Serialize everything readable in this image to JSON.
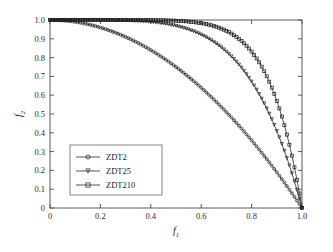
{
  "chart_data": {
    "type": "line",
    "title": "",
    "subtitle": "",
    "xlabel": "f",
    "xlabel_sub": "1",
    "ylabel": "f",
    "ylabel_sub": "2",
    "xlim": [
      0,
      1
    ],
    "ylim": [
      0,
      1
    ],
    "grid": false,
    "legend_position": "center-left",
    "xticks": [
      0,
      0.2,
      0.4,
      0.6,
      0.8,
      1.0
    ],
    "xtick_labels": [
      "0",
      "0.2",
      "0.4",
      "0.6",
      "0.8",
      "1.0"
    ],
    "yticks": [
      0,
      0.1,
      0.2,
      0.3,
      0.4,
      0.5,
      0.6,
      0.7,
      0.8,
      0.9,
      1.0
    ],
    "ytick_labels": [
      "0",
      "0.1",
      "0.2",
      "0.3",
      "0.4",
      "0.5",
      "0.6",
      "0.7",
      "0.8",
      "0.9",
      "1.0"
    ],
    "x": [
      0,
      0.02,
      0.04,
      0.06,
      0.08,
      0.1,
      0.12,
      0.14,
      0.16,
      0.18,
      0.2,
      0.22,
      0.24,
      0.26,
      0.28,
      0.3,
      0.32,
      0.34,
      0.36,
      0.38,
      0.4,
      0.42,
      0.44,
      0.46,
      0.48,
      0.5,
      0.52,
      0.54,
      0.56,
      0.58,
      0.6,
      0.62,
      0.64,
      0.66,
      0.68,
      0.7,
      0.72,
      0.74,
      0.76,
      0.78,
      0.8,
      0.82,
      0.84,
      0.86,
      0.88,
      0.9,
      0.92,
      0.94,
      0.96,
      0.98,
      1.0
    ],
    "series": [
      {
        "name": "ZDT2",
        "marker": "circle",
        "exponent": 2,
        "values": [
          1.0,
          0.9996,
          0.9984,
          0.9964,
          0.9936,
          0.99,
          0.9856,
          0.9804,
          0.9744,
          0.9676,
          0.96,
          0.9516,
          0.9424,
          0.9324,
          0.9216,
          0.91,
          0.8976,
          0.8844,
          0.8704,
          0.8556,
          0.84,
          0.8236,
          0.8064,
          0.7884,
          0.7696,
          0.75,
          0.7296,
          0.7084,
          0.6864,
          0.6636,
          0.64,
          0.6156,
          0.5904,
          0.5644,
          0.5376,
          0.51,
          0.4816,
          0.4524,
          0.4224,
          0.3916,
          0.36,
          0.3276,
          0.2944,
          0.2604,
          0.2256,
          0.19,
          0.1536,
          0.1164,
          0.0784,
          0.0396,
          0.0
        ]
      },
      {
        "name": "ZDT25",
        "marker": "triangle-down",
        "exponent": 5,
        "values": [
          1.0,
          1.0,
          1.0,
          0.9999,
          0.9997,
          0.9995,
          0.9991,
          0.9986,
          0.9978,
          0.9967,
          0.9953,
          0.9935,
          0.9913,
          0.9885,
          0.9852,
          0.9813,
          0.9765,
          0.9712,
          0.9651,
          0.9581,
          0.9501,
          0.9412,
          0.9312,
          0.9201,
          0.9077,
          0.8941,
          0.8791,
          0.8627,
          0.8448,
          0.8253,
          0.8041,
          0.7812,
          0.7564,
          0.7297,
          0.7011,
          0.6807,
          0.6361,
          0.6014,
          0.5646,
          0.5257,
          0.4826,
          0.4293,
          0.3821,
          0.3287,
          0.2723,
          0.2105,
          0.1413,
          0.0786,
          0.0438,
          0.0192,
          0.0
        ]
      },
      {
        "name": "ZDT210",
        "marker": "square",
        "exponent": 8,
        "values": [
          1.0,
          1.0,
          1.0,
          1.0,
          1.0,
          1.0,
          0.9999,
          0.9999,
          0.9998,
          0.9996,
          0.9994,
          0.9991,
          0.9986,
          0.998,
          0.9972,
          0.9961,
          0.9948,
          0.9931,
          0.9909,
          0.9883,
          0.9853,
          0.9816,
          0.9773,
          0.9723,
          0.9664,
          0.9596,
          0.9519,
          0.943,
          0.933,
          0.9217,
          0.9092,
          0.8951,
          0.8796,
          0.8624,
          0.8434,
          0.8224,
          0.7992,
          0.7738,
          0.7459,
          0.7153,
          0.6825,
          0.6402,
          0.5962,
          0.5463,
          0.4908,
          0.4305,
          0.3493,
          0.2622,
          0.1786,
          0.0862,
          0.0
        ]
      }
    ],
    "annotations": []
  },
  "legend": {
    "entries": [
      {
        "label": "ZDT2"
      },
      {
        "label": "ZDT25"
      },
      {
        "label": "ZDT210"
      }
    ]
  },
  "colors": {
    "axis": "#5a5a5a",
    "curve": "#2a2a2a",
    "marker": "#1c1c1c",
    "background": "#ffffff",
    "text": "#1a1a1a"
  }
}
